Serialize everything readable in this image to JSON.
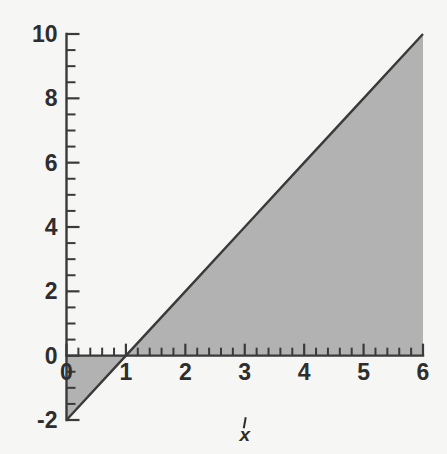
{
  "chart_data": {
    "type": "line",
    "title": "",
    "subtitle": "",
    "xlabel": "x",
    "ylabel": "",
    "xlim": [
      0,
      6
    ],
    "ylim": [
      -2,
      10
    ],
    "grid": false,
    "legend": null,
    "background_color": "#f6f6f5",
    "line_color": "#3a3a3a",
    "fill_color": "#b2b2b2",
    "axis_color": "#3a3a3a",
    "text_color": "#2e2e2e",
    "x_ticks_major": [
      0,
      1,
      2,
      3,
      4,
      5,
      6
    ],
    "x_tick_labels": [
      "0",
      "1",
      "2",
      "3",
      "4",
      "5",
      "6"
    ],
    "x_minor_step": 0.2,
    "y_ticks_major": [
      -2,
      0,
      2,
      4,
      6,
      8,
      10
    ],
    "y_tick_labels": [
      "-2",
      "0",
      "2",
      "4",
      "6",
      "8",
      "10"
    ],
    "y_minor_step": 0.5,
    "series": [
      {
        "name": "y = 2x - 2",
        "equation": "y = 2x - 2",
        "slope": 2,
        "intercept": -2,
        "x": [
          0,
          1,
          2,
          3,
          4,
          5,
          6
        ],
        "values": [
          -2,
          0,
          2,
          4,
          6,
          8,
          10
        ],
        "x_intercept": 1,
        "y_intercept": -2
      }
    ],
    "shaded_region": {
      "description": "Region between the line y = 2x - 2 and the y-axis, from x = 0 to x = 6",
      "color": "#b2b2b2",
      "polygon_x": [
        0,
        6,
        6,
        0
      ],
      "polygon_y": [
        -2,
        10,
        0,
        0
      ],
      "bounds_left_x": 0,
      "bounds_right_x": 6,
      "upper_boundary": "y = 0 for x in [0,1]; y = 2x - 2 ... region lies between line and x-axis on left of x=1 and between x-axis and line right of x=1"
    },
    "annotations": [
      {
        "text": "x",
        "role": "x-axis-title",
        "x": 3,
        "y": -2.6,
        "italic": true
      }
    ]
  },
  "axis_titles": {
    "x": "x",
    "y": ""
  },
  "labels": {
    "y_10": "10",
    "y_8": "8",
    "y_6": "6",
    "y_4": "4",
    "y_2": "2",
    "y_0": "0",
    "y_neg2": "-2",
    "x_0": "0",
    "x_1": "1",
    "x_2": "2",
    "x_3": "3",
    "x_4": "4",
    "x_5": "5",
    "x_6": "6"
  }
}
